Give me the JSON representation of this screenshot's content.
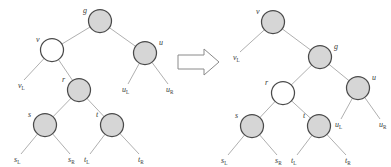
{
  "figure": {
    "transform_symbol": "double-right-arrow",
    "colors": {
      "node_gray_fill": "#d6d6d6",
      "node_white_fill": "#ffffff",
      "node_stroke": "#4a4a4a",
      "edge_stroke": "#9a9a9a",
      "label_color": "#3a3a3a",
      "background": "#ffffff"
    }
  },
  "left_tree": {
    "name": "before-rotation-tree",
    "nodes": [
      {
        "id": "g",
        "label": "g",
        "fill": "gray",
        "cx": 100,
        "cy": 21,
        "r": 11.5,
        "label_x": 83,
        "label_y": 13
      },
      {
        "id": "v",
        "label": "v",
        "fill": "white",
        "cx": 52,
        "cy": 50,
        "r": 11.5,
        "label_x": 36,
        "label_y": 42
      },
      {
        "id": "u",
        "label": "u",
        "fill": "gray",
        "cx": 145,
        "cy": 53,
        "r": 11.5,
        "label_x": 159,
        "label_y": 45
      },
      {
        "id": "r",
        "label": "r",
        "fill": "gray",
        "cx": 79,
        "cy": 90,
        "r": 11.5,
        "label_x": 62,
        "label_y": 82
      },
      {
        "id": "s",
        "label": "s",
        "fill": "gray",
        "cx": 45,
        "cy": 125,
        "r": 11.5,
        "label_x": 28,
        "label_y": 117
      },
      {
        "id": "t",
        "label": "t",
        "fill": "gray",
        "cx": 112,
        "cy": 125,
        "r": 11.5,
        "label_x": 96,
        "label_y": 117
      }
    ],
    "leaves": [
      {
        "id": "vL",
        "base": "v",
        "sub": "L",
        "x": 18,
        "y": 88,
        "edge_from": "v",
        "tip_x": 24,
        "tip_y": 80
      },
      {
        "id": "uL",
        "base": "u",
        "sub": "L",
        "x": 122,
        "y": 92,
        "edge_from": "u",
        "tip_x": 128,
        "tip_y": 84
      },
      {
        "id": "uR",
        "base": "u",
        "sub": "R",
        "x": 166,
        "y": 92,
        "edge_from": "u",
        "tip_x": 168,
        "tip_y": 84
      },
      {
        "id": "sL",
        "base": "s",
        "sub": "L",
        "x": 14,
        "y": 162,
        "edge_from": "s",
        "tip_x": 21,
        "tip_y": 154
      },
      {
        "id": "sR",
        "base": "s",
        "sub": "R",
        "x": 68,
        "y": 162,
        "edge_from": "s",
        "tip_x": 70,
        "tip_y": 154
      },
      {
        "id": "tL",
        "base": "t",
        "sub": "L",
        "x": 84,
        "y": 162,
        "edge_from": "t",
        "tip_x": 90,
        "tip_y": 154
      },
      {
        "id": "tR",
        "base": "t",
        "sub": "R",
        "x": 138,
        "y": 162,
        "edge_from": "t",
        "tip_x": 139,
        "tip_y": 154
      }
    ],
    "edges": [
      {
        "from": "g",
        "to": "v"
      },
      {
        "from": "g",
        "to": "u"
      },
      {
        "from": "v",
        "to": "r"
      },
      {
        "from": "r",
        "to": "s"
      },
      {
        "from": "r",
        "to": "t"
      }
    ]
  },
  "right_tree": {
    "name": "after-rotation-tree",
    "nodes": [
      {
        "id": "v",
        "label": "v",
        "fill": "gray",
        "cx": 78,
        "cy": 22,
        "r": 11.5,
        "label_x": 61,
        "label_y": 14
      },
      {
        "id": "g",
        "label": "g",
        "fill": "gray",
        "cx": 125,
        "cy": 57,
        "r": 11.5,
        "label_x": 139,
        "label_y": 49
      },
      {
        "id": "r",
        "label": "r",
        "fill": "white",
        "cx": 88,
        "cy": 93,
        "r": 11.5,
        "label_x": 70,
        "label_y": 85
      },
      {
        "id": "u",
        "label": "u",
        "fill": "gray",
        "cx": 163,
        "cy": 88,
        "r": 11.5,
        "label_x": 177,
        "label_y": 80
      },
      {
        "id": "s",
        "label": "s",
        "fill": "gray",
        "cx": 57,
        "cy": 126,
        "r": 11.5,
        "label_x": 40,
        "label_y": 118
      },
      {
        "id": "t",
        "label": "t",
        "fill": "gray",
        "cx": 124,
        "cy": 126,
        "r": 11.5,
        "label_x": 108,
        "label_y": 118
      }
    ],
    "leaves": [
      {
        "id": "vL",
        "base": "v",
        "sub": "L",
        "x": 38,
        "y": 60,
        "edge_from": "v",
        "tip_x": 45,
        "tip_y": 52
      },
      {
        "id": "uL",
        "base": "u",
        "sub": "L",
        "x": 140,
        "y": 127,
        "edge_from": "u",
        "tip_x": 146,
        "tip_y": 119
      },
      {
        "id": "uR",
        "base": "u",
        "sub": "R",
        "x": 184,
        "y": 127,
        "edge_from": "u",
        "tip_x": 185,
        "tip_y": 119
      },
      {
        "id": "sL",
        "base": "s",
        "sub": "L",
        "x": 26,
        "y": 163,
        "edge_from": "s",
        "tip_x": 33,
        "tip_y": 155
      },
      {
        "id": "sR",
        "base": "s",
        "sub": "R",
        "x": 80,
        "y": 163,
        "edge_from": "s",
        "tip_x": 82,
        "tip_y": 155
      },
      {
        "id": "tL",
        "base": "t",
        "sub": "L",
        "x": 96,
        "y": 163,
        "edge_from": "t",
        "tip_x": 102,
        "tip_y": 155
      },
      {
        "id": "tR",
        "base": "t",
        "sub": "R",
        "x": 150,
        "y": 163,
        "edge_from": "t",
        "tip_x": 151,
        "tip_y": 155
      }
    ],
    "edges": [
      {
        "from": "v",
        "to": "g"
      },
      {
        "from": "g",
        "to": "r"
      },
      {
        "from": "g",
        "to": "u"
      },
      {
        "from": "r",
        "to": "s"
      },
      {
        "from": "r",
        "to": "t"
      }
    ]
  }
}
